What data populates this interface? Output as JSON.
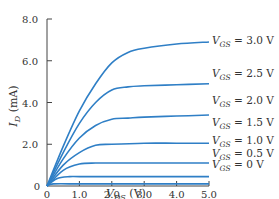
{
  "chart_data": {
    "type": "line",
    "title": "",
    "xlabel": "V_DS (V)",
    "ylabel": "I_D (mA)",
    "xlim": [
      0,
      5.0
    ],
    "ylim": [
      0,
      8.0
    ],
    "x_ticks": [
      "0",
      "1.0",
      "2.0",
      "3.0",
      "4.0",
      "5.0"
    ],
    "y_ticks": [
      "0",
      "2.0",
      "4.0",
      "6.0",
      "8.0"
    ],
    "grid": false,
    "legend_position": "inline-right",
    "series_color": "#2f7fc6",
    "series": [
      {
        "name": "V_GS = 3.0 V",
        "label_main": "V",
        "label_sub": "GS",
        "label_value": " = 3.0 V",
        "x": [
          0,
          0.5,
          1.0,
          1.5,
          2.0,
          2.5,
          3.0,
          4.0,
          5.0
        ],
        "values": [
          0,
          1.9,
          3.6,
          4.9,
          5.9,
          6.4,
          6.6,
          6.8,
          6.9
        ]
      },
      {
        "name": "V_GS = 2.5 V",
        "label_main": "V",
        "label_sub": "GS",
        "label_value": " = 2.5 V",
        "x": [
          0,
          0.5,
          1.0,
          1.5,
          2.0,
          2.5,
          3.0,
          4.0,
          5.0
        ],
        "values": [
          0,
          1.6,
          3.0,
          4.0,
          4.6,
          4.75,
          4.8,
          4.85,
          4.9
        ]
      },
      {
        "name": "V_GS = 2.0 V",
        "label_main": "V",
        "label_sub": "GS",
        "label_value": " = 2.0 V",
        "x": [
          0,
          0.5,
          1.0,
          1.5,
          2.0,
          2.5,
          3.0,
          4.0,
          5.0
        ],
        "values": [
          0,
          1.3,
          2.3,
          2.9,
          3.2,
          3.25,
          3.3,
          3.35,
          3.4
        ]
      },
      {
        "name": "V_GS = 1.5 V",
        "label_main": "V",
        "label_sub": "GS",
        "label_value": " = 1.5 V",
        "x": [
          0,
          0.5,
          1.0,
          1.5,
          2.0,
          3.0,
          4.0,
          5.0
        ],
        "values": [
          0,
          1.0,
          1.6,
          1.95,
          2.0,
          2.05,
          2.05,
          2.05
        ]
      },
      {
        "name": "V_GS = 1.0 V",
        "label_main": "V",
        "label_sub": "GS",
        "label_value": " = 1.0 V",
        "x": [
          0,
          0.5,
          1.0,
          1.5,
          2.0,
          3.0,
          4.0,
          5.0
        ],
        "values": [
          0,
          0.75,
          1.05,
          1.1,
          1.1,
          1.1,
          1.1,
          1.1
        ]
      },
      {
        "name": "V_GS = 0.5 V",
        "label_main": "V",
        "label_sub": "GS",
        "label_value": " = 0.5 V",
        "x": [
          0,
          0.3,
          0.7,
          1.0,
          2.0,
          3.0,
          4.0,
          5.0
        ],
        "values": [
          0,
          0.35,
          0.45,
          0.45,
          0.45,
          0.45,
          0.45,
          0.45
        ]
      },
      {
        "name": "V_GS = 0 V",
        "label_main": "V",
        "label_sub": "GS",
        "label_value": " = 0 V",
        "x": [
          0,
          0.2,
          1.0,
          2.0,
          3.0,
          4.0,
          5.0
        ],
        "values": [
          0,
          0.1,
          0.1,
          0.1,
          0.1,
          0.1,
          0.1
        ]
      }
    ]
  },
  "axes": {
    "y_title_main": "I",
    "y_title_sub": "D",
    "y_title_unit": " (mA)",
    "x_title_main": "V",
    "x_title_sub": "DS",
    "x_title_unit": " (V)"
  }
}
